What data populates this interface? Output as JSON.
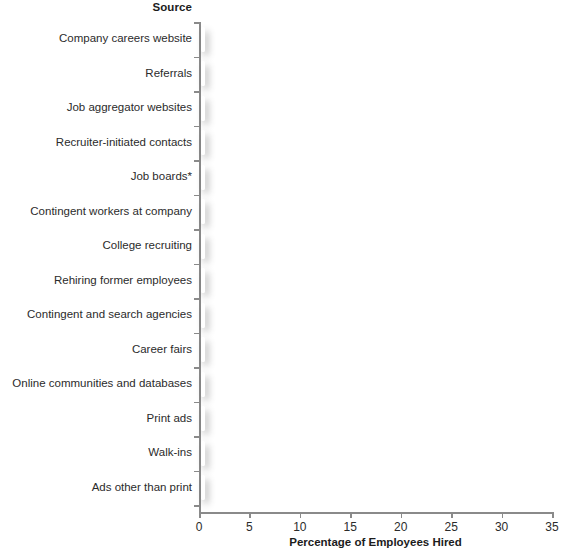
{
  "chart_data": {
    "type": "bar",
    "orientation": "horizontal",
    "title": "",
    "xlabel": "Percentage of Employees Hired",
    "ylabel": "Source",
    "xlim": [
      0,
      35
    ],
    "xticks": [
      0,
      5,
      10,
      15,
      20,
      25,
      30,
      35
    ],
    "grid": false,
    "legend": null,
    "categories": [
      "Company careers website",
      "Referrals",
      "Job aggregator websites",
      "Recruiter-initiated contacts",
      "Job boards*",
      "Contingent workers at company",
      "College recruiting",
      "Rehiring former employees",
      "Contingent and search agencies",
      "Career fairs",
      "Online communities and databases",
      "Print ads",
      "Walk-ins",
      "Ads other than print"
    ],
    "values": [
      31.2,
      22.1,
      17.2,
      11.3,
      9.8,
      8.8,
      8.4,
      6.7,
      3.5,
      2.9,
      2.8,
      2.0,
      1.4,
      1.1
    ],
    "bar_color": "#474747",
    "bar_border_color": "#ffffff",
    "axis_color": "#8a8a8a"
  },
  "footnote": ""
}
